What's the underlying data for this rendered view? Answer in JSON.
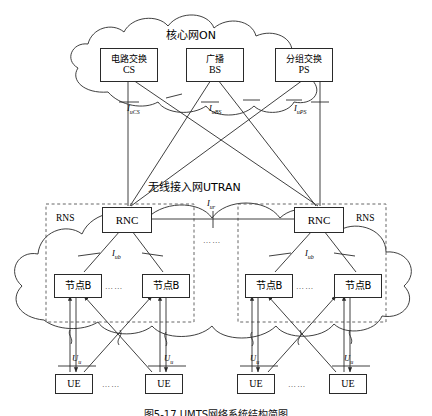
{
  "diagram": {
    "caption": "图5-17  UMTS网络系统结构简图",
    "core_network": {
      "cloud_label": "核心网ON",
      "nodes": [
        {
          "zh": "电路交换",
          "en": "CS"
        },
        {
          "zh": "广播",
          "en": "BS"
        },
        {
          "zh": "分组交换",
          "en": "PS"
        }
      ]
    },
    "access_network": {
      "cloud_label": "无线接入网UTRAN",
      "rns_label_left": "RNS",
      "rns_label_right": "RNS",
      "rnc_left": "RNC",
      "rnc_right": "RNC",
      "nodebs": [
        "节点B",
        "节点B",
        "节点B",
        "节点B"
      ]
    },
    "terminals": {
      "ue": [
        "UE",
        "UE",
        "UE",
        "UE"
      ]
    },
    "interfaces": {
      "iu_cs": {
        "name": "I",
        "sub": "uCS"
      },
      "iu_bs": {
        "name": "I",
        "sub": "uBS"
      },
      "iu_ps": {
        "name": "I",
        "sub": "uPS"
      },
      "iur": {
        "name": "I",
        "sub": "ur"
      },
      "iub_left": {
        "name": "I",
        "sub": "ub"
      },
      "iub_right": {
        "name": "I",
        "sub": "ub"
      },
      "uu": [
        {
          "name": "U",
          "sub": "u"
        },
        {
          "name": "U",
          "sub": "u"
        },
        {
          "name": "U",
          "sub": "u"
        },
        {
          "name": "U",
          "sub": "u"
        }
      ]
    },
    "ellipses": [
      "……",
      "……",
      "……",
      "……",
      "……",
      "……",
      "……"
    ],
    "colors": {
      "stroke": "#2a2a2a",
      "dashed": "#555555",
      "text": "#000000"
    }
  }
}
